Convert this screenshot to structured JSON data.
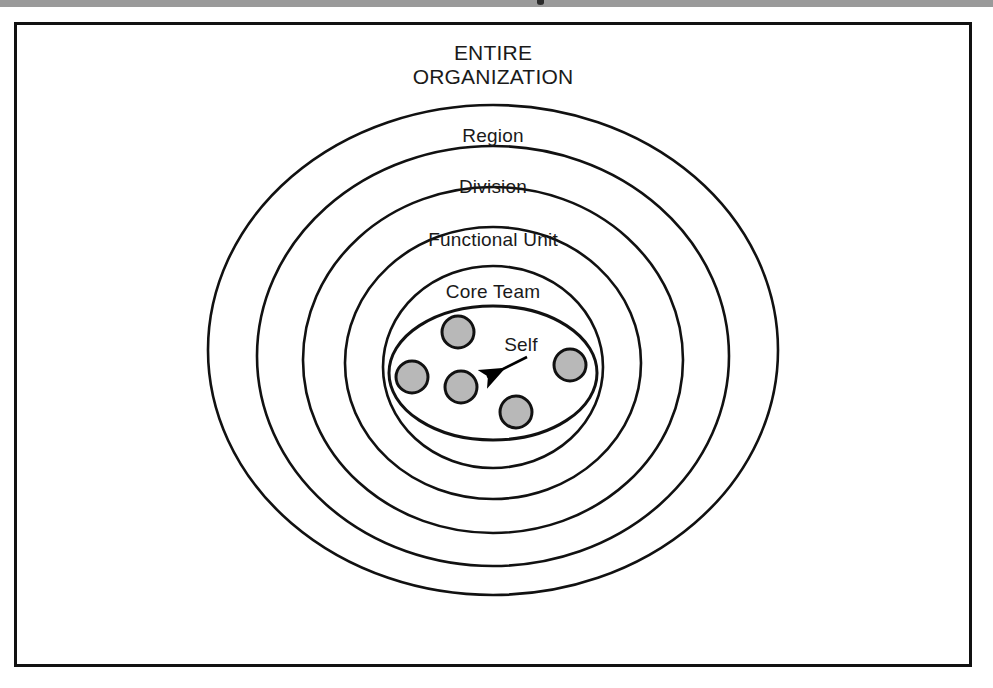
{
  "figure": {
    "kind": "concentric-ellipse-diagram",
    "title": {
      "line1": "ENTIRE",
      "line2": "ORGANIZATION"
    },
    "rings": [
      {
        "label": "ENTIRE ORGANIZATION",
        "level": 1,
        "cx": 493,
        "cy": 350,
        "rx": 285,
        "ry": 245
      },
      {
        "label": "Region",
        "level": 2,
        "cx": 493,
        "cy": 356,
        "rx": 236,
        "ry": 210
      },
      {
        "label": "Division",
        "level": 3,
        "cx": 493,
        "cy": 360,
        "rx": 190,
        "ry": 173
      },
      {
        "label": "Functional Unit",
        "level": 4,
        "cx": 493,
        "cy": 363,
        "rx": 148,
        "ry": 136
      },
      {
        "label": "Core Team",
        "level": 5,
        "cx": 493,
        "cy": 367,
        "rx": 110,
        "ry": 101
      },
      {
        "label": "",
        "level": 6,
        "cx": 493,
        "cy": 373,
        "rx": 104,
        "ry": 67
      }
    ],
    "ring_labels": [
      {
        "text": "Region",
        "x": 493,
        "y": 125
      },
      {
        "text": "Division",
        "x": 493,
        "y": 176
      },
      {
        "text": "Functional Unit",
        "x": 493,
        "y": 229
      },
      {
        "text": "Core Team",
        "x": 493,
        "y": 281
      }
    ],
    "members": [
      {
        "name": "member-top",
        "cx": 458,
        "cy": 332,
        "r": 16,
        "is_self": false
      },
      {
        "name": "member-left",
        "cx": 412,
        "cy": 377,
        "r": 16,
        "is_self": false
      },
      {
        "name": "member-self",
        "cx": 461,
        "cy": 387,
        "r": 16,
        "is_self": true
      },
      {
        "name": "member-bottom",
        "cx": 516,
        "cy": 412,
        "r": 16,
        "is_self": false
      },
      {
        "name": "member-right",
        "cx": 570,
        "cy": 365,
        "r": 16,
        "is_self": false
      }
    ],
    "annotation": {
      "label": "Self",
      "label_x": 521,
      "label_y": 334,
      "arrow_from_x": 527,
      "arrow_from_y": 357,
      "arrow_to_x": 479,
      "arrow_to_y": 381
    },
    "colors": {
      "page_background": "#ffffff",
      "scan_band": "#9a9a9a",
      "frame_border": "#111111",
      "ellipse_stroke": "#111111",
      "member_fill": "#b8b8b8",
      "member_stroke": "#111111",
      "text": "#1a1a1a",
      "arrow": "#000000"
    }
  }
}
